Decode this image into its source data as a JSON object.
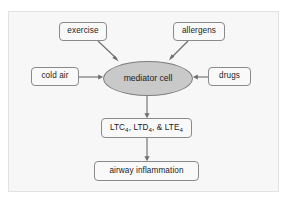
{
  "diagram": {
    "frame": {
      "background_color": "#f7f7f7",
      "border_color": "#e2e2e2"
    },
    "style": {
      "box_fill": "#f9f9f9",
      "box_border": "#8a8a8a",
      "ellipse_fill": "#c9c9c9",
      "ellipse_border": "#7d7d7d",
      "arrow_color": "#6f6f6f",
      "text_color": "#1c1c1c"
    },
    "nodes": {
      "exercise": {
        "label": "exercise",
        "shape": "rounded-rect"
      },
      "allergens": {
        "label": "allergens",
        "shape": "rounded-rect"
      },
      "cold_air": {
        "label": "cold air",
        "shape": "rounded-rect"
      },
      "drugs": {
        "label": "drugs",
        "shape": "rounded-rect"
      },
      "mediator_cell": {
        "label": "mediator cell",
        "shape": "ellipse"
      },
      "leukotrienes": {
        "label": "LTC4, LTD4, & LTE4",
        "shape": "rounded-rect",
        "parts": {
          "ltc": "LTC",
          "ltc_sub": "4",
          "sep1": ", ",
          "ltd": "LTD",
          "ltd_sub": "4",
          "sep2": ", & ",
          "lte": "LTE",
          "lte_sub": "4"
        }
      },
      "airway_inflammation": {
        "label": "airway inflammation",
        "shape": "rounded-rect"
      }
    },
    "edges": [
      {
        "from": "exercise",
        "to": "mediator_cell",
        "direction": "down-right"
      },
      {
        "from": "allergens",
        "to": "mediator_cell",
        "direction": "down-left"
      },
      {
        "from": "cold_air",
        "to": "mediator_cell",
        "direction": "right"
      },
      {
        "from": "drugs",
        "to": "mediator_cell",
        "direction": "left"
      },
      {
        "from": "mediator_cell",
        "to": "leukotrienes",
        "direction": "down"
      },
      {
        "from": "leukotrienes",
        "to": "airway_inflammation",
        "direction": "down"
      }
    ]
  }
}
